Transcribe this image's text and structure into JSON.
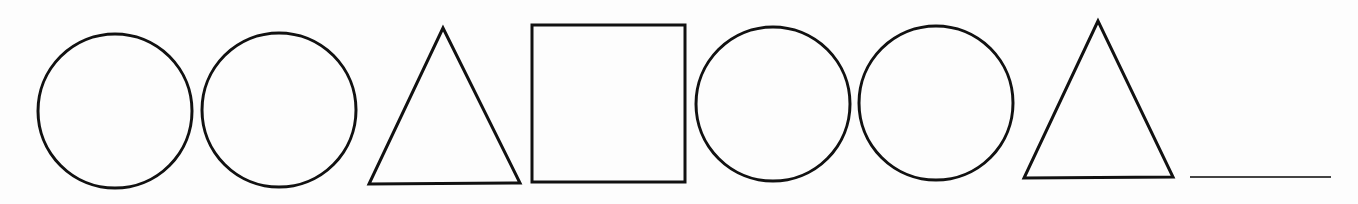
{
  "puzzle": {
    "title": "Shape sequence pattern",
    "stroke_color": "#111111",
    "blank_color": "#444444",
    "background": "#fdfdfd",
    "sequence": [
      {
        "shape": "circle",
        "cx": 115,
        "cy": 111,
        "r": 77
      },
      {
        "shape": "circle",
        "cx": 279,
        "cy": 110,
        "r": 77
      },
      {
        "shape": "triangle",
        "points": "443,28 369,184 520,183"
      },
      {
        "shape": "square",
        "x": 532,
        "y": 25,
        "w": 153,
        "h": 157
      },
      {
        "shape": "circle",
        "cx": 773,
        "cy": 104,
        "r": 77
      },
      {
        "shape": "circle",
        "cx": 936,
        "cy": 103,
        "r": 77
      },
      {
        "shape": "triangle",
        "points": "1098,21 1024,178 1173,177"
      },
      {
        "shape": "blank",
        "x1": 1190,
        "y1": 177,
        "x2": 1331,
        "y2": 177
      }
    ]
  }
}
